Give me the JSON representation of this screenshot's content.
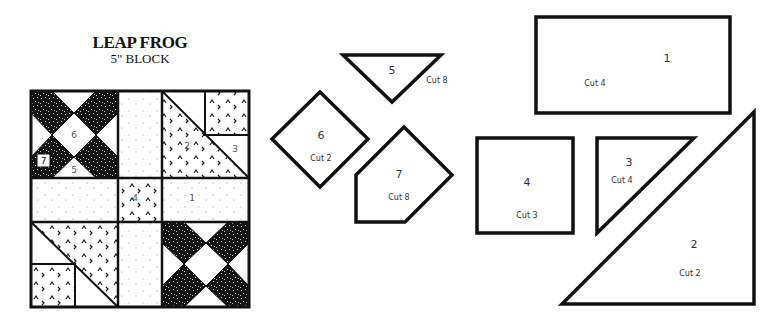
{
  "title": {
    "name": "LEAP FROG",
    "subtitle": "5\" BLOCK"
  },
  "block": {
    "labels": {
      "p6": "6",
      "p7": "7",
      "p5": "5",
      "p2": "2",
      "p3": "3",
      "p4": "4",
      "p1": "1"
    }
  },
  "templates": [
    {
      "piece": "5",
      "cut": "Cut 8",
      "shape": "triangle"
    },
    {
      "piece": "6",
      "cut": "Cut 2",
      "shape": "diamond"
    },
    {
      "piece": "7",
      "cut": "Cut 8",
      "shape": "pentagon"
    },
    {
      "piece": "1",
      "cut": "Cut 4",
      "shape": "rectangle"
    },
    {
      "piece": "4",
      "cut": "Cut 3",
      "shape": "square"
    },
    {
      "piece": "3",
      "cut": "Cut 4",
      "shape": "small-right-triangle"
    },
    {
      "piece": "2",
      "cut": "Cut 2",
      "shape": "large-right-triangle"
    }
  ],
  "colors": {
    "outline": "#111111",
    "dark_fabric": "#141414",
    "background": "#ffffff"
  }
}
